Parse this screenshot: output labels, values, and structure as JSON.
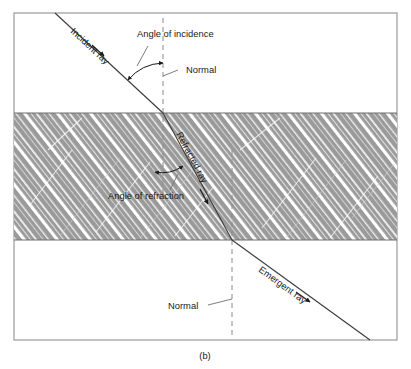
{
  "figure": {
    "caption": "(b)",
    "frame": {
      "x": 14,
      "y": 13,
      "width": 383,
      "height": 327,
      "border_color": "#9a9a9a",
      "background_color": "#ffffff"
    },
    "slab": {
      "label": "glass-slab",
      "top": 113,
      "bottom": 240,
      "fill_color": "#9a9a9a",
      "hatch_color": "#ffffff",
      "hatch_angle_deg": -38
    }
  },
  "labels": {
    "incident_ray": "Incident ray",
    "angle_of_incidence": "Angle of incidence",
    "normal_top": "Normal",
    "refracted_ray": "Refracted ray",
    "angle_of_refraction": "Angle of refraction",
    "normal_bottom": "Normal",
    "emergent_ray": "Emergent ray"
  },
  "geometry": {
    "ray_color": "#3a3a3a",
    "normal_color": "#8a8a8a",
    "incident_start": {
      "x": 55,
      "y": 13
    },
    "entry_point": {
      "x": 163,
      "y": 113
    },
    "exit_point": {
      "x": 232,
      "y": 240
    },
    "emergent_end": {
      "x": 370,
      "y": 340
    },
    "normal_top_x": 163,
    "normal_bottom_x": 232,
    "incident_label_rotation_deg": 43,
    "refracted_label_rotation_deg": 62,
    "emergent_label_rotation_deg": 36
  }
}
